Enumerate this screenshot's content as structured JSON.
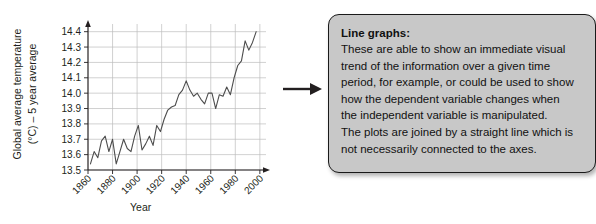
{
  "chart_data": {
    "type": "line",
    "title": "",
    "xlabel": "Year",
    "ylabel": "Global average temperature (°C) - 5 year average",
    "ylabel_line1": "Global average temperature",
    "ylabel_line2": "(°C) – 5 year average",
    "xlim": [
      1860,
      2005
    ],
    "ylim": [
      13.5,
      14.45
    ],
    "grid": true,
    "legend": "none",
    "series_color": "#4d4d4d",
    "xticks": [
      "1860",
      "1880",
      "1900",
      "1920",
      "1940",
      "1960",
      "1980",
      "2000"
    ],
    "xtick_values": [
      1860,
      1880,
      1900,
      1920,
      1940,
      1960,
      1980,
      2000
    ],
    "yticks": [
      "13.5",
      "13.6",
      "13.7",
      "13.8",
      "13.9",
      "14.0",
      "14.1",
      "14.2",
      "14.3",
      "14.4"
    ],
    "ytick_values": [
      13.5,
      13.6,
      13.7,
      13.8,
      13.9,
      14.0,
      14.1,
      14.2,
      14.3,
      14.4
    ],
    "x": [
      1862,
      1865,
      1868,
      1871,
      1874,
      1877,
      1880,
      1883,
      1886,
      1889,
      1892,
      1895,
      1898,
      1901,
      1904,
      1907,
      1910,
      1913,
      1916,
      1919,
      1922,
      1925,
      1928,
      1931,
      1934,
      1937,
      1940,
      1943,
      1946,
      1949,
      1952,
      1955,
      1958,
      1961,
      1964,
      1967,
      1970,
      1973,
      1976,
      1979,
      1982,
      1985,
      1988,
      1991,
      1994,
      1997
    ],
    "values": [
      13.54,
      13.62,
      13.58,
      13.69,
      13.72,
      13.62,
      13.7,
      13.54,
      13.62,
      13.7,
      13.64,
      13.62,
      13.72,
      13.79,
      13.63,
      13.67,
      13.72,
      13.66,
      13.79,
      13.75,
      13.83,
      13.89,
      13.91,
      13.92,
      13.99,
      14.02,
      14.08,
      14.02,
      13.98,
      14.0,
      13.96,
      13.93,
      14.0,
      14.0,
      13.9,
      13.99,
      13.98,
      14.04,
      13.99,
      14.1,
      14.18,
      14.21,
      14.34,
      14.28,
      14.33,
      14.4
    ]
  },
  "flow": {
    "arrow_name": "right-arrow"
  },
  "callout": {
    "heading": "Line graphs:",
    "lines": [
      "These are able to show an immediate visual",
      "trend of the information over a given time",
      "period, for example, or could be used to show",
      "how the dependent variable changes when",
      "the independent variable is manipulated.",
      "The plots are joined by a straight line which is",
      "not necessarily connected to the axes."
    ],
    "background_color": "#c8c8c8",
    "border_color": "#1a1a1a"
  }
}
